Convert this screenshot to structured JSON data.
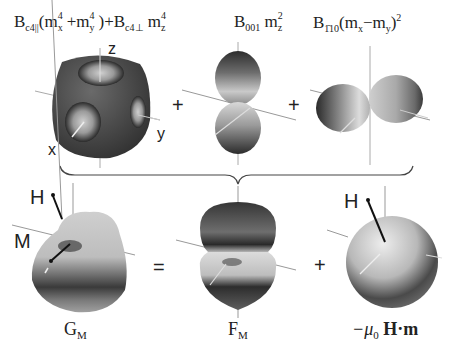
{
  "top_row": {
    "term1": {
      "formula_parts": {
        "B": "B",
        "sub_parallel": "c4||",
        "open": "(m",
        "sx": "x",
        "p4a": "4",
        "plus": "+m",
        "sy": "y",
        "p4b": "4",
        "close": ")+B",
        "sub_perp": "c4⊥",
        "mz": " m",
        "sz": "z",
        "p4c": "4"
      },
      "axis_labels": {
        "x": "x",
        "y": "y",
        "z": "z"
      }
    },
    "term2": {
      "formula_parts": {
        "B": "B",
        "sub": "001",
        "m": " m",
        "sz": "z",
        "p2": "2"
      }
    },
    "term3": {
      "formula_parts": {
        "B": "B",
        "sub": "1̄10",
        "open": "(m",
        "sx": "x",
        "minus": "−m",
        "sy": "y",
        "close": ")",
        "p2": "2"
      }
    },
    "operators": [
      "+",
      "+"
    ]
  },
  "bottom_row": {
    "labels": {
      "G": "G",
      "G_sub": "M",
      "F": "F",
      "F_sub": "M",
      "mu": "−μ",
      "mu_sub": "0",
      "Hdotm": " H·m"
    },
    "operators": [
      "=",
      "+"
    ],
    "vector_labels": {
      "H_left": "H",
      "M_left": "M",
      "H_right": "H"
    }
  },
  "colors": {
    "surface_dark": "#3a3a3a",
    "surface_light": "#e8e8e8",
    "axis": "#999999",
    "background": "#ffffff"
  }
}
